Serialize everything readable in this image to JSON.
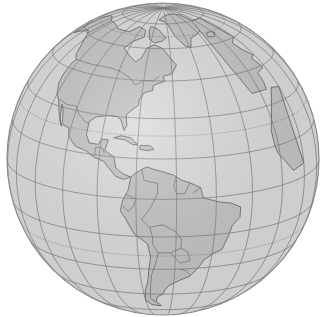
{
  "map": {
    "type": "orthographic-globe",
    "center_lon": -65,
    "center_lat": 15,
    "view": "Western hemisphere (the Americas)",
    "visible_regions": [
      "North America",
      "Central America",
      "Caribbean",
      "South America",
      "Greenland",
      "Western Europe",
      "Western Africa"
    ],
    "graticule": {
      "meridian_step_deg": 15,
      "parallel_step_deg": 15,
      "special_parallels": [
        "Equator",
        "Tropic of Cancer",
        "Tropic of Capricorn"
      ]
    }
  },
  "colors": {
    "background": "#ffffff",
    "ocean": "#dcdcdc",
    "land": "#c4c4c4",
    "graticule": "#7a7a7a",
    "border": "#5e5e5e",
    "rim": "#8a8a8a"
  }
}
